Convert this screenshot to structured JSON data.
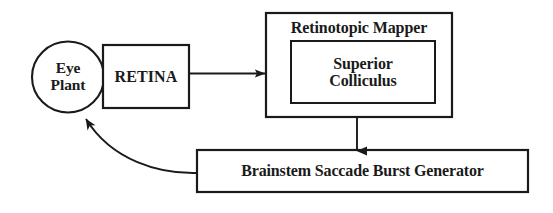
{
  "diagram": {
    "background_color": "#ffffff",
    "stroke_color": "#1a1a1a",
    "text_color": "#1a1a1a",
    "nodes": {
      "eye_plant": {
        "label": "Eye\nPlant",
        "shape": "ellipse"
      },
      "retina": {
        "label": "RETINA",
        "shape": "rectangle"
      },
      "retinotopic_mapper": {
        "label": "Retinotopic Mapper",
        "shape": "rectangle"
      },
      "superior_colliculus": {
        "label": "Superior\nColliculus",
        "shape": "rectangle"
      },
      "brainstem_generator": {
        "label": "Brainstem Saccade Burst Generator",
        "shape": "rectangle"
      }
    },
    "edges": [
      {
        "name": "retina-to-mapper",
        "from": "retina",
        "to": "retinotopic_mapper",
        "style": "straight-arrow",
        "direction": "right"
      },
      {
        "name": "mapper-to-brainstem",
        "from": "retinotopic_mapper",
        "to": "brainstem_generator",
        "style": "straight-arrow",
        "direction": "down"
      },
      {
        "name": "brainstem-to-eye-plant",
        "from": "brainstem_generator",
        "to": "eye_plant",
        "style": "curved-arrow",
        "direction": "up-left"
      },
      {
        "name": "eye-plant-to-retina",
        "from": "eye_plant",
        "to": "retina",
        "style": "adjacent",
        "direction": "right"
      }
    ]
  }
}
